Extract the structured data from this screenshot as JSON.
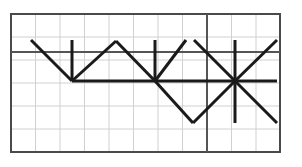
{
  "figure": {
    "type": "ray-diagram",
    "width": 302,
    "height": 167,
    "background_color": "#ffffff"
  },
  "canvas": {
    "background_color": "#ffffff",
    "frame": {
      "x": 11,
      "y": 14,
      "width": 269,
      "height": 138,
      "stroke_color": "#4a4a4a",
      "stroke_width": 2
    }
  },
  "grid": {
    "cell_size": 24.5,
    "origin_x": 11,
    "origin_y": 14,
    "columns": 11,
    "rows": 6,
    "line_color": "#d0d0d0",
    "line_width": 1,
    "vertical_x": [
      35.5,
      60,
      84.5,
      109,
      133.5,
      158,
      182.5,
      207,
      231.5,
      256
    ],
    "horizontal_y": [
      37,
      60,
      83,
      106,
      129
    ]
  },
  "axes": {
    "horizontal_line": {
      "label": "surface-line",
      "y": 52,
      "x1": 11,
      "x2": 280,
      "stroke_color": "#555555",
      "stroke_width": 2
    },
    "vertical_line": {
      "label": "boundary-line",
      "x": 207,
      "y1": 14,
      "y2": 152,
      "stroke_color": "#555555",
      "stroke_width": 2
    }
  },
  "rays": {
    "stroke_color": "#1a1a1a",
    "stroke_width": 3,
    "segments": [
      {
        "name": "incident-ray-1",
        "x1": 31,
        "y1": 40,
        "x2": 72,
        "y2": 81
      },
      {
        "name": "reflected-ray-1",
        "x1": 72,
        "y1": 81,
        "x2": 116,
        "y2": 41
      },
      {
        "name": "incident-ray-2",
        "x1": 116,
        "y1": 41,
        "x2": 155,
        "y2": 81
      },
      {
        "name": "reflected-ray-2",
        "x1": 155,
        "y1": 81,
        "x2": 193,
        "y2": 123
      },
      {
        "name": "incident-ray-3",
        "x1": 193,
        "y1": 123,
        "x2": 235,
        "y2": 81
      },
      {
        "name": "reflected-ray-3",
        "x1": 235,
        "y1": 81,
        "x2": 277,
        "y2": 123
      },
      {
        "name": "upper-ray-left",
        "x1": 155,
        "y1": 81,
        "x2": 186,
        "y2": 40
      },
      {
        "name": "upper-ray-right",
        "x1": 194,
        "y1": 40,
        "x2": 235,
        "y2": 81
      },
      {
        "name": "upper-ray-far",
        "x1": 235,
        "y1": 81,
        "x2": 277,
        "y2": 40
      },
      {
        "name": "base-horizontal-ray",
        "x1": 72,
        "y1": 81,
        "x2": 277,
        "y2": 81
      }
    ],
    "normals": [
      {
        "name": "normal-line-1",
        "x": 72,
        "y1": 40,
        "y2": 81
      },
      {
        "name": "normal-line-2",
        "x": 155,
        "y1": 40,
        "y2": 81
      },
      {
        "name": "normal-line-3",
        "x": 235,
        "y1": 40,
        "y2": 123
      }
    ],
    "vertices": [
      {
        "name": "reflection-point-1",
        "x": 72,
        "y": 81
      },
      {
        "name": "peak-point",
        "x": 116,
        "y": 41
      },
      {
        "name": "reflection-point-2",
        "x": 155,
        "y": 81
      },
      {
        "name": "trough-point",
        "x": 193,
        "y": 123
      },
      {
        "name": "star-point",
        "x": 235,
        "y": 81
      }
    ]
  }
}
